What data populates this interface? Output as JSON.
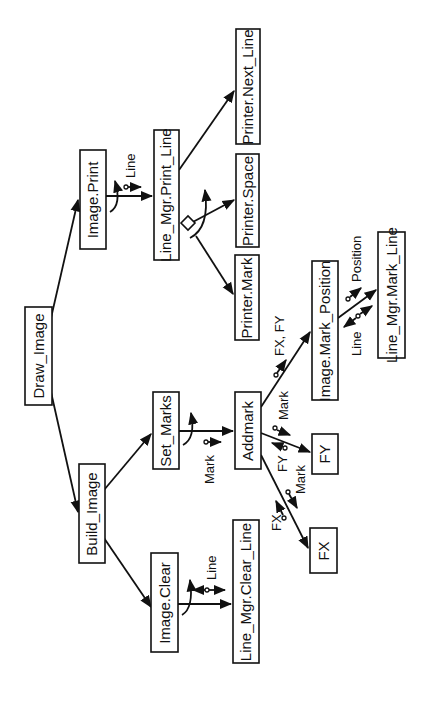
{
  "diagram": {
    "type": "structure-chart",
    "orientation": "rotated-90-ccw",
    "modules": [
      {
        "id": "draw_image",
        "label": "Draw_Image"
      },
      {
        "id": "image_print",
        "label": "Image.Print"
      },
      {
        "id": "build_image",
        "label": "Build_Image"
      },
      {
        "id": "line_mgr_print_line",
        "label": "Line_Mgr.Print_Line"
      },
      {
        "id": "printer_next_line",
        "label": "Printer.Next_Line"
      },
      {
        "id": "printer_space",
        "label": "Printer.Space"
      },
      {
        "id": "printer_mark",
        "label": "Printer.Mark"
      },
      {
        "id": "set_marks",
        "label": "Set_Marks"
      },
      {
        "id": "addmark",
        "label": "Addmark"
      },
      {
        "id": "image_mark_position",
        "label": "Image.Mark_Position"
      },
      {
        "id": "line_mgr_mark_line",
        "label": "Line_Mgr.Mark_Line"
      },
      {
        "id": "fy",
        "label": "FY"
      },
      {
        "id": "fx",
        "label": "FX"
      },
      {
        "id": "image_clear",
        "label": "Image.Clear"
      },
      {
        "id": "line_mgr_clear_line",
        "label": "Line_Mgr.Clear_Line"
      }
    ],
    "calls": [
      {
        "from": "Draw_Image",
        "to": "Image.Print"
      },
      {
        "from": "Draw_Image",
        "to": "Build_Image"
      },
      {
        "from": "Image.Print",
        "to": "Line_Mgr.Print_Line",
        "data": [
          "Line"
        ],
        "loop": true
      },
      {
        "from": "Line_Mgr.Print_Line",
        "to": "Printer.Next_Line"
      },
      {
        "from": "Line_Mgr.Print_Line",
        "to": "Printer.Space",
        "conditional": true,
        "loop": true
      },
      {
        "from": "Line_Mgr.Print_Line",
        "to": "Printer.Mark",
        "conditional": true,
        "loop": true
      },
      {
        "from": "Build_Image",
        "to": "Set_Marks"
      },
      {
        "from": "Build_Image",
        "to": "Image.Clear"
      },
      {
        "from": "Set_Marks",
        "to": "Addmark",
        "data": [
          "Mark"
        ],
        "loop": true
      },
      {
        "from": "Addmark",
        "to": "Image.Mark_Position",
        "data": [
          "FX, FY"
        ]
      },
      {
        "from": "Addmark",
        "to": "FY",
        "data": [
          "Mark"
        ],
        "returns": [
          "FY"
        ]
      },
      {
        "from": "Addmark",
        "to": "FX",
        "data": [
          "Mark"
        ],
        "returns": [
          "FX"
        ]
      },
      {
        "from": "Image.Mark_Position",
        "to": "Line_Mgr.Mark_Line",
        "data": [
          "Position"
        ],
        "returns": [
          "Line"
        ]
      },
      {
        "from": "Image.Clear",
        "to": "Line_Mgr.Clear_Line",
        "data": [
          "Line"
        ],
        "loop": true,
        "bidirectional": true
      }
    ],
    "flow_labels": {
      "print_line": "Line",
      "clear_line": "Line",
      "set_mark": "Mark",
      "fxfy": "FX, FY",
      "fy_mark": "Mark",
      "fy_ret": "FY",
      "fx_mark": "Mark",
      "fx_ret": "FX",
      "position": "Position",
      "mark_line_ret": "Line"
    }
  }
}
